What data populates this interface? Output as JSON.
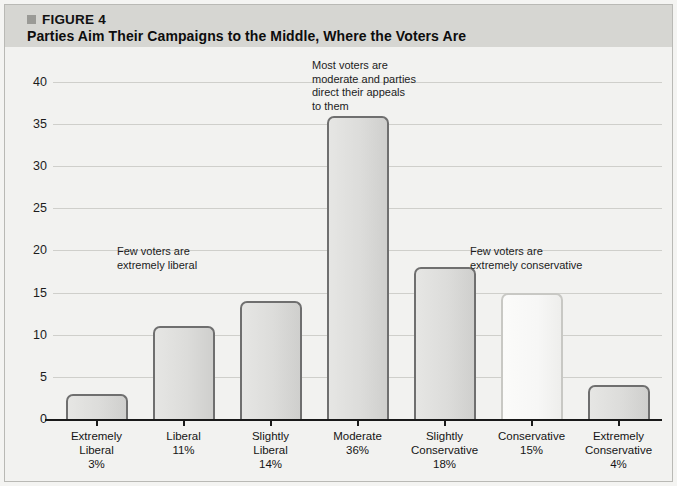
{
  "header": {
    "figure_marker": "square-marker-icon",
    "figure_tag": "FIGURE 4",
    "title": "Parties Aim Their Campaigns to the Middle, Where the Voters Are"
  },
  "chart_data": {
    "type": "bar",
    "title": "Parties Aim Their Campaigns to the Middle, Where the Voters Are",
    "xlabel": "",
    "ylabel": "",
    "ylim": [
      0,
      42
    ],
    "yticks": [
      0,
      5,
      10,
      15,
      20,
      25,
      30,
      35,
      40
    ],
    "ytick_labels": [
      "0",
      "5",
      "10",
      "15",
      "20",
      "25",
      "30",
      "35",
      "40"
    ],
    "grid": true,
    "legend": "none",
    "categories": [
      "Extremely Liberal",
      "Liberal",
      "Slightly Liberal",
      "Moderate",
      "Slightly Conservative",
      "Conservative",
      "Extremely Conservative"
    ],
    "category_lines": [
      [
        "Extremely",
        "Liberal"
      ],
      [
        "Liberal"
      ],
      [
        "Slightly",
        "Liberal"
      ],
      [
        "Moderate"
      ],
      [
        "Slightly",
        "Conservative"
      ],
      [
        "Conservative"
      ],
      [
        "Extremely",
        "Conservative"
      ]
    ],
    "values": [
      3,
      11,
      14,
      36,
      18,
      15,
      4
    ],
    "value_labels": [
      "3%",
      "11%",
      "14%",
      "36%",
      "18%",
      "15%",
      "4%"
    ],
    "bar_styles": [
      "shaded",
      "shaded",
      "shaded",
      "shaded",
      "shaded",
      "light",
      "shaded"
    ],
    "annotations": [
      {
        "id": "annotation-few-liberal",
        "lines": [
          "Few voters are",
          "extremely liberal"
        ]
      },
      {
        "id": "annotation-most-moderate",
        "lines": [
          "Most voters are",
          "moderate and parties",
          "direct their appeals",
          "to them"
        ]
      },
      {
        "id": "annotation-few-conservative",
        "lines": [
          "Few voters are",
          "extremely conservative"
        ]
      }
    ]
  },
  "colors": {
    "header_band": "#d6d6d2",
    "panel": "#f2f2f0",
    "bar_border": "#6f6f6f",
    "bar_fill": "#dcdcda",
    "light_bar_fill": "#f8f8f7",
    "gridline": "#cfcfcb",
    "axis": "#1a1a1a"
  }
}
